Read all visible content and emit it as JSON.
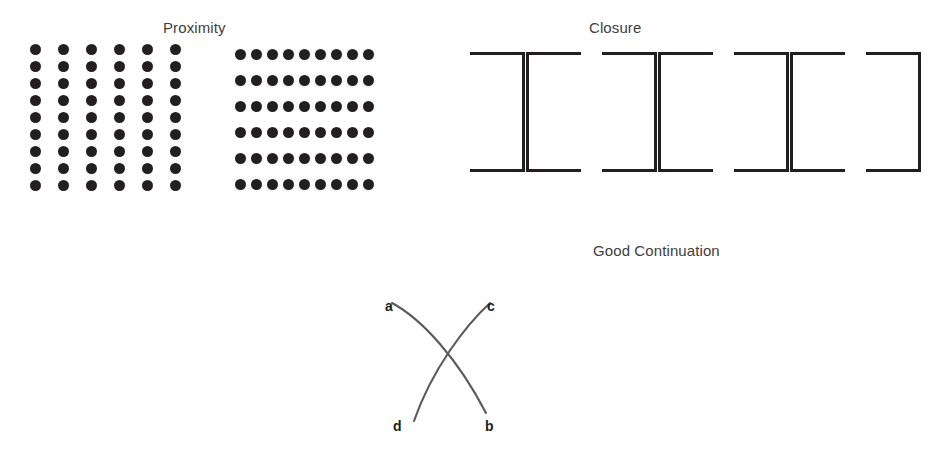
{
  "figure": {
    "background_color": "#ffffff",
    "ink_color": "#231f20",
    "text_color": "#404040",
    "width": 935,
    "height": 449
  },
  "sections": {
    "proximity": {
      "title": "Proximity",
      "grid_columns": {
        "name": "column-grouped-dots",
        "columns": 6,
        "rows": 9,
        "total_dots": 54,
        "column_spacing_px": 28,
        "row_spacing_px": 17
      },
      "grid_rows": {
        "name": "row-grouped-dots",
        "columns": 9,
        "rows": 6,
        "total_dots": 54,
        "column_spacing_px": 16,
        "row_spacing_px": 26
      }
    },
    "closure": {
      "title": "Closure",
      "bracket_count": 7,
      "brackets": [
        {
          "facing": "right",
          "glyph": "]",
          "x": 470
        },
        {
          "facing": "left",
          "glyph": "[",
          "x": 526
        },
        {
          "facing": "right",
          "glyph": "]",
          "x": 602
        },
        {
          "facing": "left",
          "glyph": "[",
          "x": 658
        },
        {
          "facing": "right",
          "glyph": "]",
          "x": 734
        },
        {
          "facing": "left",
          "glyph": "[",
          "x": 790
        },
        {
          "facing": "right",
          "glyph": "]",
          "x": 866
        }
      ]
    },
    "good_continuation": {
      "title": "Good Continuation",
      "curves": [
        {
          "name": "curve-a-b",
          "from": "a",
          "to": "b"
        },
        {
          "name": "curve-c-d",
          "from": "c",
          "to": "d"
        }
      ],
      "labels": [
        {
          "id": "a",
          "text": "a",
          "position": "top-left"
        },
        {
          "id": "c",
          "text": "c",
          "position": "top-right"
        },
        {
          "id": "d",
          "text": "d",
          "position": "bottom-left"
        },
        {
          "id": "b",
          "text": "b",
          "position": "bottom-right"
        }
      ]
    }
  }
}
